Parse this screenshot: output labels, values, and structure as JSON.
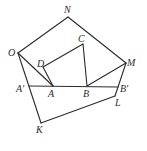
{
  "diagram": {
    "type": "geometry",
    "points": [
      {
        "id": "N",
        "label": "N"
      },
      {
        "id": "O",
        "label": "O"
      },
      {
        "id": "C",
        "label": "C"
      },
      {
        "id": "M",
        "label": "M"
      },
      {
        "id": "D",
        "label": "D"
      },
      {
        "id": "A1",
        "label": "A'"
      },
      {
        "id": "A",
        "label": "A"
      },
      {
        "id": "B",
        "label": "B"
      },
      {
        "id": "B1",
        "label": "B'"
      },
      {
        "id": "L",
        "label": "L"
      },
      {
        "id": "K",
        "label": "K"
      }
    ],
    "segments": [
      [
        "O",
        "N"
      ],
      [
        "N",
        "M"
      ],
      [
        "O",
        "A"
      ],
      [
        "D",
        "A"
      ],
      [
        "D",
        "C"
      ],
      [
        "C",
        "B"
      ],
      [
        "B",
        "M"
      ],
      [
        "A1",
        "B1"
      ],
      [
        "O",
        "K"
      ],
      [
        "K",
        "L"
      ],
      [
        "L",
        "M"
      ]
    ]
  }
}
